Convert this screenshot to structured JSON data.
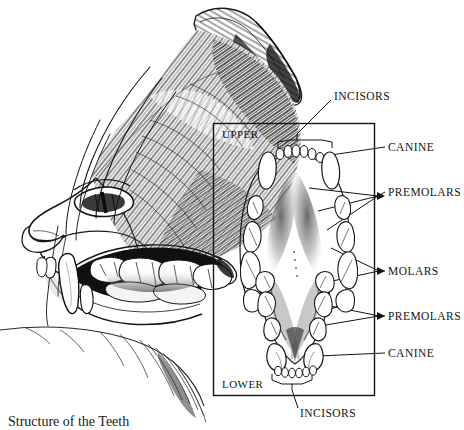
{
  "figure": {
    "caption": "Structure of the Teeth",
    "background_color": "#ffffff",
    "ink_color": "#141414"
  },
  "inset_box": {
    "label_upper": "UPPER",
    "label_lower": "LOWER",
    "x": 213,
    "y": 123,
    "width": 162,
    "height": 273
  },
  "labels": [
    {
      "id": "incisors-upper",
      "text": "INCISORS",
      "x": 334,
      "y": 97
    },
    {
      "id": "canine-upper",
      "text": "CANINE",
      "x": 388,
      "y": 148
    },
    {
      "id": "premolars-upper",
      "text": "PREMOLARS",
      "x": 388,
      "y": 193
    },
    {
      "id": "molars",
      "text": "MOLARS",
      "x": 388,
      "y": 272
    },
    {
      "id": "premolars-lower",
      "text": "PREMOLARS",
      "x": 388,
      "y": 317
    },
    {
      "id": "canine-lower",
      "text": "CANINE",
      "x": 388,
      "y": 354
    },
    {
      "id": "incisors-lower",
      "text": "INCISORS",
      "x": 300,
      "y": 414
    }
  ],
  "upper_arcade": {
    "incisors_count": 6,
    "canines_count": 2,
    "premolars_per_side": 3,
    "molars_per_side": 1
  },
  "lower_arcade": {
    "incisors_count": 6,
    "canines_count": 2,
    "premolars_per_side": 2,
    "molars_per_side": 1
  }
}
